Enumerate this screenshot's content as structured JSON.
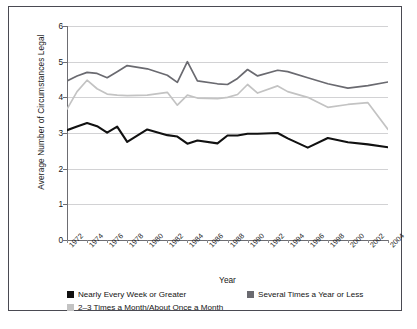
{
  "chart_data": {
    "type": "line",
    "title": "",
    "xlabel": "Year",
    "ylabel": "Average Number of Circumstances Legal",
    "ylim": [
      0,
      6
    ],
    "yticks": [
      0,
      1,
      2,
      3,
      4,
      5,
      6
    ],
    "xlim": [
      1972,
      2004
    ],
    "xticks": [
      1972,
      1974,
      1976,
      1978,
      1980,
      1982,
      1984,
      1986,
      1988,
      1990,
      1992,
      1994,
      1996,
      1998,
      2000,
      2002,
      2004
    ],
    "grid": "horizontal",
    "legend_position": "below",
    "x": [
      1972,
      1973,
      1974,
      1975,
      1976,
      1977,
      1978,
      1980,
      1982,
      1983,
      1984,
      1985,
      1987,
      1988,
      1989,
      1990,
      1991,
      1993,
      1994,
      1996,
      1998,
      2000,
      2002,
      2004
    ],
    "series": [
      {
        "name": "Nearly Every Week or Greater",
        "color": "#111111",
        "values": [
          3.08,
          3.18,
          3.28,
          3.19,
          3.01,
          3.18,
          2.75,
          3.1,
          2.94,
          2.9,
          2.7,
          2.79,
          2.71,
          2.93,
          2.93,
          2.98,
          2.98,
          3.0,
          2.85,
          2.59,
          2.86,
          2.74,
          2.68,
          2.6
        ]
      },
      {
        "name": "2–3 Times a Month/About Once a Month",
        "color": "#c3c3c3",
        "values": [
          3.67,
          4.16,
          4.48,
          4.24,
          4.09,
          4.06,
          4.05,
          4.06,
          4.14,
          3.78,
          4.06,
          3.98,
          3.96,
          4.0,
          4.08,
          4.36,
          4.12,
          4.32,
          4.16,
          4.0,
          3.72,
          3.8,
          3.85,
          3.1
        ]
      },
      {
        "name": "Several Times a Year or Less",
        "color": "#6a6a70",
        "values": [
          4.46,
          4.6,
          4.7,
          4.67,
          4.55,
          4.72,
          4.89,
          4.8,
          4.62,
          4.42,
          5.0,
          4.46,
          4.38,
          4.36,
          4.53,
          4.78,
          4.6,
          4.76,
          4.72,
          4.55,
          4.38,
          4.26,
          4.33,
          4.43
        ]
      }
    ]
  },
  "axis": {
    "y_title": "Average Number of Circumstances Legal",
    "x_title": "Year",
    "y_tick_labels": [
      "6",
      "5",
      "4",
      "3",
      "2",
      "1",
      "0"
    ],
    "x_tick_labels": [
      "1972",
      "1974",
      "1976",
      "1978",
      "1980",
      "1982",
      "1984",
      "1986",
      "1988",
      "1990",
      "1992",
      "1994",
      "1996",
      "1998",
      "2000",
      "2002",
      "2004"
    ]
  },
  "legend": {
    "items": [
      {
        "label": "Nearly Every Week or Greater",
        "color": "#111111"
      },
      {
        "label": "Several Times a Year or Less",
        "color": "#6a6a70"
      },
      {
        "label": "2–3 Times a Month/About Once a Month",
        "color": "#c3c3c3"
      }
    ]
  }
}
